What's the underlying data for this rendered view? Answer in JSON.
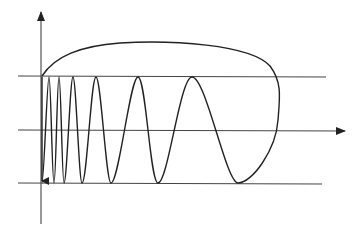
{
  "diagram": {
    "axis_label_y": "y",
    "colors": {
      "stroke": "#222222",
      "background": "#ffffff"
    }
  }
}
